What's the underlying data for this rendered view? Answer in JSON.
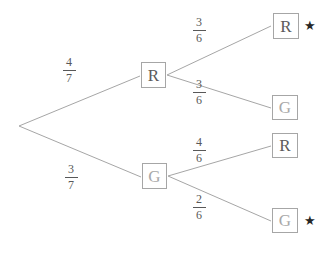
{
  "diagram": {
    "type": "probability-tree",
    "stroke_color": "#a6a6a6",
    "text_color": "#585858",
    "star_symbol": "★",
    "root": {
      "label": "",
      "x": 19,
      "y": 126
    },
    "level1": [
      {
        "id": "n-r1",
        "label": "R",
        "kind": "red",
        "probability_numerator": "4",
        "probability_denominator": "7",
        "x": 141,
        "y": 62
      },
      {
        "id": "n-g1",
        "label": "G",
        "kind": "green",
        "probability_numerator": "3",
        "probability_denominator": "7",
        "x": 142,
        "y": 163
      }
    ],
    "level2": [
      {
        "id": "n-rr",
        "label": "R",
        "kind": "red",
        "parent": "n-r1",
        "probability_numerator": "3",
        "probability_denominator": "6",
        "starred": true,
        "x": 273,
        "y": 13
      },
      {
        "id": "n-rg",
        "label": "G",
        "kind": "green",
        "parent": "n-r1",
        "probability_numerator": "3",
        "probability_denominator": "6",
        "starred": false,
        "x": 272,
        "y": 95
      },
      {
        "id": "n-gr",
        "label": "R",
        "kind": "red",
        "parent": "n-g1",
        "probability_numerator": "4",
        "probability_denominator": "6",
        "starred": false,
        "x": 272,
        "y": 133
      },
      {
        "id": "n-gg",
        "label": "G",
        "kind": "green",
        "parent": "n-g1",
        "probability_numerator": "2",
        "probability_denominator": "6",
        "starred": true,
        "x": 272,
        "y": 208
      }
    ],
    "fraction_labels": [
      {
        "id": "f-4-7",
        "numerator": "4",
        "denominator": "7",
        "x": 58,
        "y": 56
      },
      {
        "id": "f-3-7",
        "numerator": "3",
        "denominator": "7",
        "x": 60,
        "y": 163
      },
      {
        "id": "f-3-6-top",
        "numerator": "3",
        "denominator": "6",
        "x": 188,
        "y": 16
      },
      {
        "id": "f-3-6-bottom",
        "numerator": "3",
        "denominator": "6",
        "x": 188,
        "y": 78
      },
      {
        "id": "f-4-6",
        "numerator": "4",
        "denominator": "6",
        "x": 188,
        "y": 136
      },
      {
        "id": "f-2-6",
        "numerator": "2",
        "denominator": "6",
        "x": 188,
        "y": 193
      }
    ],
    "stars": [
      {
        "id": "star-rr",
        "glyph": "★",
        "x": 304,
        "y": 19
      },
      {
        "id": "star-gg",
        "glyph": "★",
        "x": 304,
        "y": 214
      }
    ]
  }
}
